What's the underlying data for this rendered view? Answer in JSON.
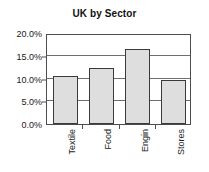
{
  "chart_data": {
    "type": "bar",
    "title": "UK by Sector",
    "xlabel": "",
    "ylabel": "",
    "categories": [
      "Textile",
      "Food",
      "Engin",
      "Stores"
    ],
    "values": [
      10.5,
      12.3,
      16.4,
      9.6
    ],
    "value_format": "percent",
    "ylim": [
      0.0,
      20.0
    ],
    "ytick_values": [
      0.0,
      5.0,
      10.0,
      15.0,
      20.0
    ],
    "ytick_labels": [
      "0.0%",
      "5.0%",
      "10.0%",
      "15.0%",
      "20.0%"
    ],
    "grid": true,
    "grid_axis": "y",
    "legend": false,
    "legend_position": "none",
    "series": [
      {
        "name": "UK by Sector",
        "values": [
          10.5,
          12.3,
          16.4,
          9.6
        ]
      }
    ],
    "colors": {
      "bar_fill": "#dedede",
      "bar_border": "#3a3a3a",
      "gridline": "#6e6e6e",
      "axis": "#4d4d4d",
      "text": "#1a1a1a",
      "background": "#ffffff"
    }
  }
}
